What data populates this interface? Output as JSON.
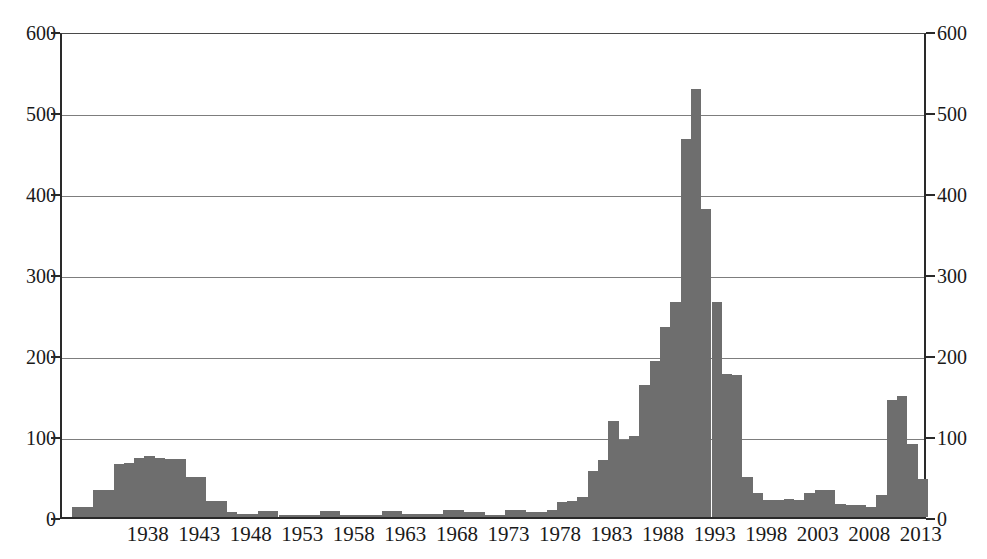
{
  "chart_data": {
    "type": "bar",
    "title": "",
    "subtitle": "",
    "xlabel": "",
    "ylabel": "",
    "xlim": [
      1930,
      2014
    ],
    "ylim": [
      0,
      600
    ],
    "grid": true,
    "legend": null,
    "bar_color": "#6e6e6e",
    "axis_color": "#2a2a2a",
    "gridline_color": "#7d7d7d",
    "y_ticks": [
      0,
      100,
      200,
      300,
      400,
      500,
      600
    ],
    "y_tick_labels": [
      "0",
      "100",
      "200",
      "300",
      "400",
      "500",
      "600"
    ],
    "y_axis_right_mirrored": true,
    "x_ticks": [
      1938,
      1943,
      1948,
      1953,
      1958,
      1963,
      1968,
      1973,
      1978,
      1983,
      1988,
      1993,
      1998,
      2003,
      2008,
      2013
    ],
    "x_tick_labels": [
      "1938",
      "1943",
      "1948",
      "1953",
      "1958",
      "1963",
      "1968",
      "1973",
      "1978",
      "1983",
      "1988",
      "1993",
      "1998",
      "2003",
      "2008",
      "2013"
    ],
    "x": [
      1931,
      1932,
      1933,
      1934,
      1935,
      1936,
      1937,
      1938,
      1939,
      1940,
      1941,
      1942,
      1943,
      1944,
      1945,
      1946,
      1947,
      1948,
      1949,
      1950,
      1951,
      1952,
      1953,
      1954,
      1955,
      1956,
      1957,
      1958,
      1959,
      1960,
      1961,
      1962,
      1963,
      1964,
      1965,
      1966,
      1967,
      1968,
      1969,
      1970,
      1971,
      1972,
      1973,
      1974,
      1975,
      1976,
      1977,
      1978,
      1979,
      1980,
      1981,
      1982,
      1983,
      1984,
      1985,
      1986,
      1987,
      1988,
      1989,
      1990,
      1991,
      1992,
      1993,
      1994,
      1995,
      1996,
      1997,
      1998,
      1999,
      2000,
      2001,
      2002,
      2003,
      2004,
      2005,
      2006,
      2007,
      2008,
      2009,
      2010,
      2011,
      2012,
      2013
    ],
    "values": [
      12,
      12,
      33,
      33,
      65,
      67,
      73,
      75,
      73,
      72,
      72,
      50,
      50,
      20,
      20,
      6,
      4,
      4,
      7,
      7,
      3,
      3,
      3,
      3,
      7,
      7,
      3,
      3,
      3,
      3,
      8,
      8,
      4,
      4,
      4,
      4,
      9,
      9,
      6,
      6,
      3,
      3,
      9,
      9,
      6,
      6,
      9,
      19,
      20,
      25,
      57,
      70,
      118,
      95,
      100,
      163,
      193,
      235,
      265,
      467,
      528,
      380,
      265,
      177,
      175,
      50,
      30,
      21,
      21,
      22,
      21,
      30,
      33,
      33,
      16,
      15,
      15,
      12,
      27,
      145,
      150,
      90,
      47
    ],
    "peak": {
      "year": 1991,
      "value": 528
    }
  },
  "axis": {
    "left_label": "",
    "right_label": ""
  }
}
